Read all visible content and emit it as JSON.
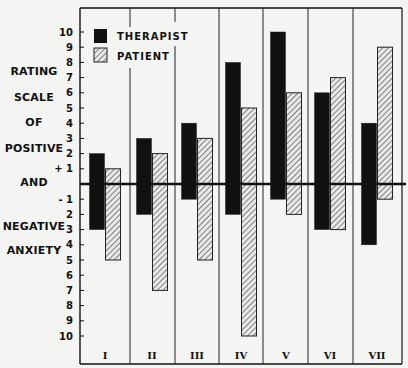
{
  "chart_data": {
    "type": "bar",
    "title": "",
    "ylabel_lines": [
      "RATING",
      "SCALE",
      "OF",
      "POSITIVE",
      "AND",
      "NEGATIVE",
      "ANXIETY"
    ],
    "xlabel": "",
    "categories": [
      "I",
      "II",
      "III",
      "IV",
      "V",
      "VI",
      "VII"
    ],
    "ylim": [
      -10,
      10
    ],
    "yticks_positive": [
      "10",
      "9",
      "8",
      "7",
      "6",
      "5",
      "4",
      "3",
      "2",
      "+ 1"
    ],
    "yticks_negative": [
      "- 1",
      "2",
      "3",
      "4",
      "5",
      "6",
      "7",
      "8",
      "9",
      "10"
    ],
    "legend": {
      "placement": "top-left",
      "entries": [
        "THERAPIST",
        "PATIENT"
      ]
    },
    "series": [
      {
        "name": "THERAPIST",
        "fill": "solid-black",
        "color": "#111111",
        "positive": [
          2,
          3,
          4,
          8,
          10,
          6,
          4
        ],
        "negative": [
          3,
          2,
          1,
          2,
          1,
          3,
          4
        ]
      },
      {
        "name": "PATIENT",
        "fill": "diagonal-hatch",
        "color": "#555555",
        "positive": [
          1,
          2,
          3,
          5,
          6,
          7,
          9
        ],
        "negative": [
          5,
          7,
          5,
          10,
          2,
          3,
          1
        ]
      }
    ],
    "grid": false
  }
}
